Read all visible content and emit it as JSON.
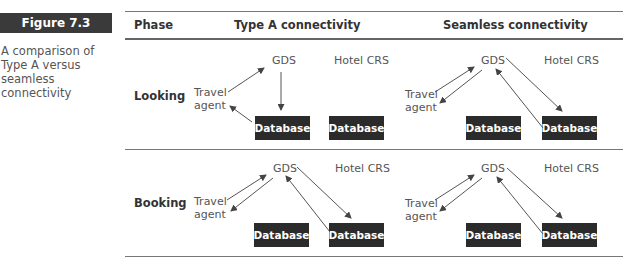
{
  "figure": {
    "label": "Figure 7.3",
    "caption": "A comparison of Type A versus seamless connectivity"
  },
  "table": {
    "headers": {
      "phase": "Phase",
      "type_a": "Type A connectivity",
      "seamless": "Seamless connectivity"
    },
    "rows": [
      {
        "phase": "Looking",
        "type_a": {
          "gds": "GDS",
          "hotel_crs": "Hotel CRS",
          "agent_line1": "Travel",
          "agent_line2": "agent",
          "db_left": "Database",
          "db_right": "Database"
        },
        "seamless": {
          "gds": "GDS",
          "hotel_crs": "Hotel CRS",
          "agent_line1": "Travel",
          "agent_line2": "agent",
          "db_left": "Database",
          "db_right": "Database"
        }
      },
      {
        "phase": "Booking",
        "type_a": {
          "gds": "GDS",
          "hotel_crs": "Hotel CRS",
          "agent_line1": "Travel",
          "agent_line2": "agent",
          "db_left": "Database",
          "db_right": "Database"
        },
        "seamless": {
          "gds": "GDS",
          "hotel_crs": "Hotel CRS",
          "agent_line1": "Travel",
          "agent_line2": "agent",
          "db_left": "Database",
          "db_right": "Database"
        }
      }
    ]
  },
  "colors": {
    "badge_bg": "#3a3a3a",
    "database_bg": "#2b2b2b",
    "rule": "#777777",
    "text": "#333333"
  }
}
